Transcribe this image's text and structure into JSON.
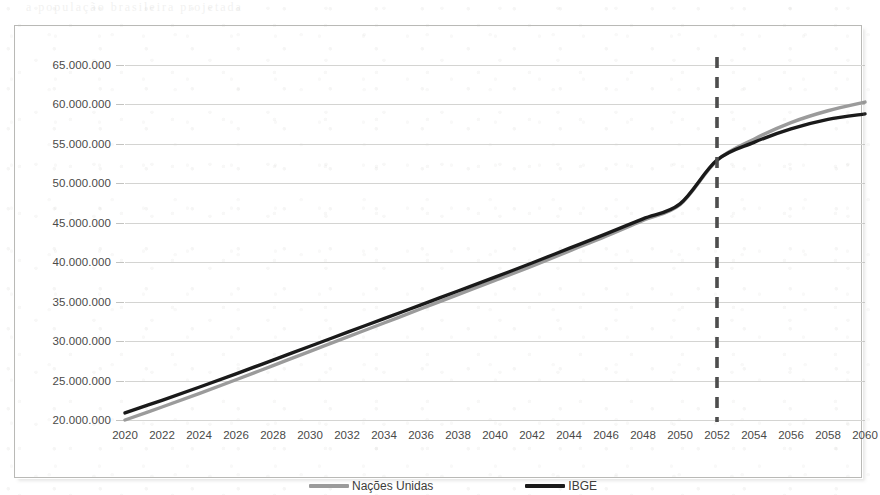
{
  "bleed_text": "a população brasileira projetada",
  "chart_data": {
    "type": "line",
    "title": "",
    "subtitle": "",
    "xlabel": "",
    "ylabel": "",
    "grid": true,
    "legend_position": "bottom",
    "xlim": [
      2020,
      2060
    ],
    "ylim": [
      20000000,
      65000000
    ],
    "ytick_step": 5000000,
    "ytick_labels": [
      "65.000.000",
      "60.000.000",
      "55.000.000",
      "50.000.000",
      "45.000.000",
      "40.000.000",
      "35.000.000",
      "30.000.000",
      "25.000.000",
      "20.000.000"
    ],
    "ytick_values": [
      65000000,
      60000000,
      55000000,
      50000000,
      45000000,
      40000000,
      35000000,
      30000000,
      25000000,
      20000000
    ],
    "categories": [
      "2020",
      "2022",
      "2024",
      "2026",
      "2028",
      "2030",
      "2032",
      "2034",
      "2036",
      "2038",
      "2040",
      "2042",
      "2044",
      "2046",
      "2048",
      "2050",
      "2052",
      "2054",
      "2056",
      "2058",
      "2060"
    ],
    "x": [
      2020,
      2022,
      2024,
      2026,
      2028,
      2030,
      2032,
      2034,
      2036,
      2038,
      2040,
      2042,
      2044,
      2046,
      2048,
      2050,
      2052,
      2054,
      2056,
      2058,
      2060
    ],
    "series": [
      {
        "name": "Nações Unidas",
        "color": "#9b9b9b",
        "values": [
          20000000,
          21650000,
          23350000,
          25100000,
          26900000,
          28700000,
          30500000,
          32300000,
          34100000,
          35900000,
          37700000,
          39500000,
          41400000,
          43300000,
          45300000,
          47300000,
          52900000,
          55600000,
          57700000,
          59200000,
          60300000
        ]
      },
      {
        "name": "IBGE",
        "color": "#1a1a1a",
        "values": [
          20900000,
          22500000,
          24150000,
          25850000,
          27600000,
          29350000,
          31100000,
          32850000,
          34600000,
          36350000,
          38100000,
          39900000,
          41750000,
          43600000,
          45500000,
          47400000,
          52950000,
          55200000,
          56900000,
          58100000,
          58800000
        ]
      }
    ],
    "annotations": [
      {
        "type": "vertical-dashed-line",
        "label": "2052",
        "x": 2052,
        "color": "#4d4d4d"
      }
    ]
  }
}
